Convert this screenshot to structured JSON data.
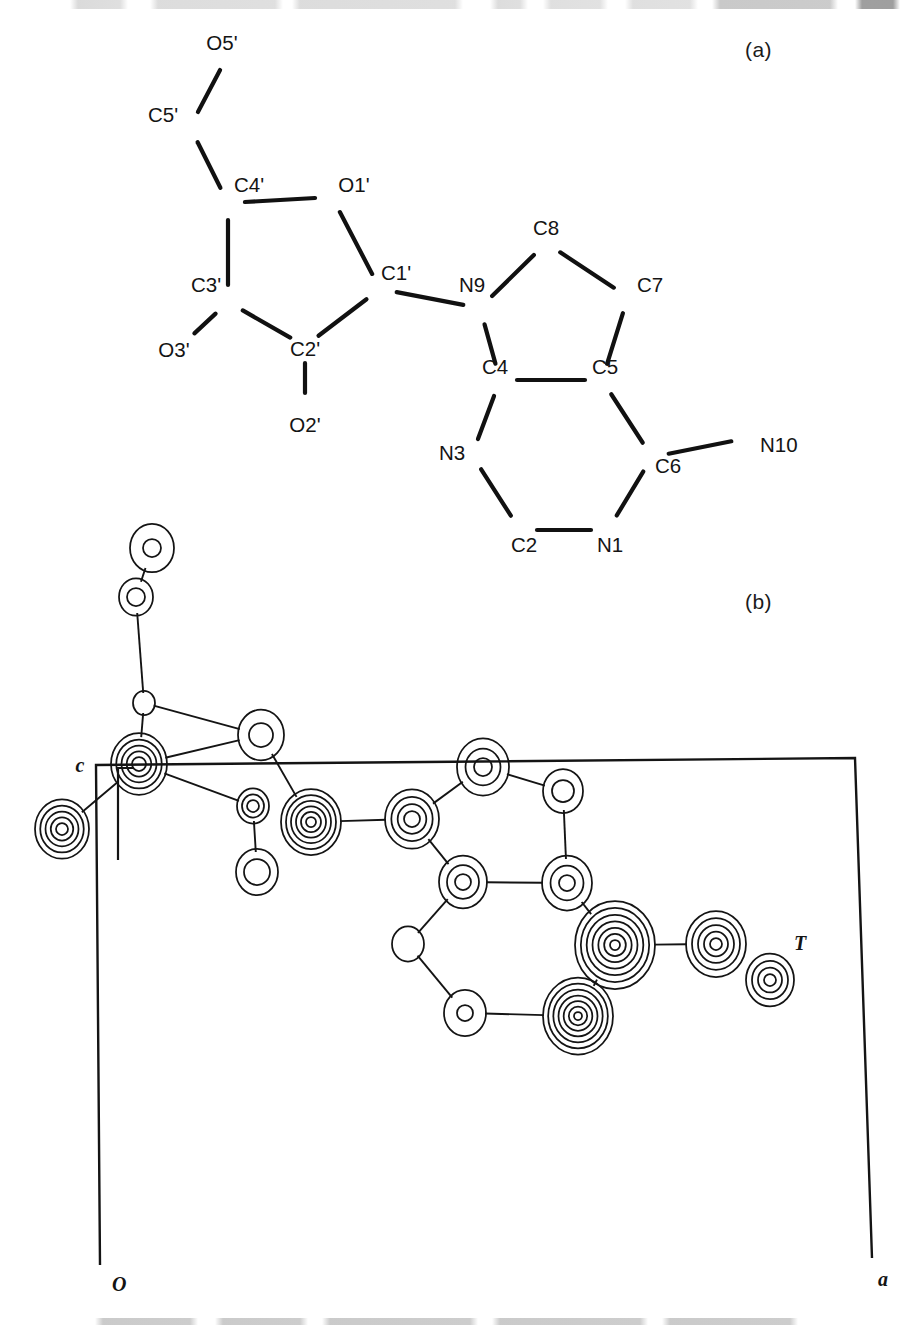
{
  "figure": {
    "panel_a_label": "(a)",
    "panel_b_label": "(b)",
    "panel_a_type": "atom-numbering-diagram",
    "panel_b_type": "electron-density-contour-map"
  },
  "chart_data": {
    "type": "scatter",
    "title": "",
    "subtitle": "",
    "xlabel": "a",
    "ylabel": "c",
    "grid": false,
    "legend": null,
    "panels": [
      {
        "id": "a",
        "label": "(a)",
        "kind": "molecular-skeleton",
        "description": "Atom-numbering scheme of the nucleoside: ribose sugar ring plus 7-deazapurine base",
        "atoms": [
          {
            "name": "O5'",
            "label": "O5'",
            "x": 228,
            "y": 55,
            "lx": 222,
            "ly": 50,
            "anchor": "middle"
          },
          {
            "name": "C5'",
            "label": "C5'",
            "x": 190,
            "y": 127,
            "lx": 163,
            "ly": 122,
            "anchor": "middle"
          },
          {
            "name": "C4'",
            "label": "C4'",
            "x": 228,
            "y": 203,
            "lx": 249,
            "ly": 192,
            "anchor": "middle"
          },
          {
            "name": "O1'",
            "label": "O1'",
            "x": 332,
            "y": 197,
            "lx": 354,
            "ly": 192,
            "anchor": "middle"
          },
          {
            "name": "C1'",
            "label": "C1'",
            "x": 380,
            "y": 289,
            "lx": 396,
            "ly": 280,
            "anchor": "middle"
          },
          {
            "name": "C2'",
            "label": "C2'",
            "x": 305,
            "y": 346,
            "lx": 305,
            "ly": 356,
            "anchor": "middle"
          },
          {
            "name": "C3'",
            "label": "C3'",
            "x": 228,
            "y": 302,
            "lx": 206,
            "ly": 292,
            "anchor": "middle"
          },
          {
            "name": "O3'",
            "label": "O3'",
            "x": 182,
            "y": 345,
            "lx": 174,
            "ly": 357,
            "anchor": "middle"
          },
          {
            "name": "O2'",
            "label": "O2'",
            "x": 305,
            "y": 410,
            "lx": 305,
            "ly": 432,
            "anchor": "middle"
          },
          {
            "name": "N9",
            "label": "N9",
            "x": 480,
            "y": 308,
            "lx": 472,
            "ly": 292,
            "anchor": "middle"
          },
          {
            "name": "C8",
            "label": "C8",
            "x": 546,
            "y": 243,
            "lx": 546,
            "ly": 235,
            "anchor": "middle"
          },
          {
            "name": "C7",
            "label": "C7",
            "x": 628,
            "y": 297,
            "lx": 650,
            "ly": 292,
            "anchor": "middle"
          },
          {
            "name": "C5",
            "label": "C5",
            "x": 602,
            "y": 380,
            "lx": 605,
            "ly": 374,
            "anchor": "middle"
          },
          {
            "name": "C4",
            "label": "C4",
            "x": 500,
            "y": 380,
            "lx": 495,
            "ly": 374,
            "anchor": "middle"
          },
          {
            "name": "N3",
            "label": "N3",
            "x": 472,
            "y": 455,
            "lx": 452,
            "ly": 460,
            "anchor": "middle"
          },
          {
            "name": "C2",
            "label": "C2",
            "x": 520,
            "y": 530,
            "lx": 524,
            "ly": 552,
            "anchor": "middle"
          },
          {
            "name": "N1",
            "label": "N1",
            "x": 608,
            "y": 530,
            "lx": 610,
            "ly": 552,
            "anchor": "middle"
          },
          {
            "name": "C6",
            "label": "C6",
            "x": 652,
            "y": 457,
            "lx": 668,
            "ly": 473,
            "anchor": "middle"
          },
          {
            "name": "N10",
            "label": "N10",
            "x": 748,
            "y": 438,
            "lx": 760,
            "ly": 452,
            "anchor": "start"
          }
        ],
        "bonds": [
          [
            "O5'",
            "C5'"
          ],
          [
            "C5'",
            "C4'"
          ],
          [
            "C4'",
            "O1'"
          ],
          [
            "O1'",
            "C1'"
          ],
          [
            "C1'",
            "C2'"
          ],
          [
            "C2'",
            "C3'"
          ],
          [
            "C3'",
            "C4'"
          ],
          [
            "C3'",
            "O3'"
          ],
          [
            "C2'",
            "O2'"
          ],
          [
            "C1'",
            "N9"
          ],
          [
            "N9",
            "C8"
          ],
          [
            "C8",
            "C7"
          ],
          [
            "C7",
            "C5"
          ],
          [
            "C5",
            "C4"
          ],
          [
            "C4",
            "N9"
          ],
          [
            "C4",
            "N3"
          ],
          [
            "N3",
            "C2"
          ],
          [
            "C2",
            "N1"
          ],
          [
            "N1",
            "C6"
          ],
          [
            "C6",
            "C5"
          ],
          [
            "C6",
            "N10"
          ]
        ]
      },
      {
        "id": "b",
        "label": "(b)",
        "kind": "contour-density-map",
        "description": "Electron density map projected down the b axis onto the a-c plane of the unit cell",
        "axis_labels": {
          "origin": "O",
          "horizontal": "a",
          "vertical": "c"
        },
        "site_label": "T",
        "unit_cell_outline": [
          [
            100,
            1265
          ],
          [
            96,
            765
          ],
          [
            855,
            758
          ],
          [
            872,
            1258
          ]
        ],
        "c_bracket": {
          "tick_x": 118,
          "top_y": 768,
          "bottom_y": 860,
          "stub_len": 16,
          "label_x": 80,
          "label_y": 766
        },
        "t_label": {
          "x": 800,
          "y": 950
        },
        "contour_atoms": [
          {
            "name": "O5'",
            "x": 152,
            "y": 548,
            "rings": 2,
            "rmax": 22,
            "rmin": 9
          },
          {
            "name": "C5'",
            "x": 136,
            "y": 597,
            "rings": 2,
            "rmax": 17,
            "rmin": 9
          },
          {
            "name": "C4'",
            "x": 144,
            "y": 703,
            "rings": 1,
            "rmax": 11,
            "rmin": 11
          },
          {
            "name": "O1'",
            "x": 261,
            "y": 735,
            "rings": 2,
            "rmax": 23,
            "rmin": 12
          },
          {
            "name": "C3'",
            "x": 139,
            "y": 764,
            "rings": 5,
            "rmax": 28,
            "rmin": 7
          },
          {
            "name": "O3'",
            "x": 62,
            "y": 829,
            "rings": 5,
            "rmax": 27,
            "rmin": 6
          },
          {
            "name": "C1'",
            "x": 253,
            "y": 806,
            "rings": 3,
            "rmax": 16,
            "rmin": 6
          },
          {
            "name": "O2'",
            "x": 257,
            "y": 872,
            "rings": 2,
            "rmax": 21,
            "rmin": 13
          },
          {
            "name": "C2'",
            "x": 311,
            "y": 822,
            "rings": 6,
            "rmax": 30,
            "rmin": 5
          },
          {
            "name": "N9",
            "x": 412,
            "y": 819,
            "rings": 4,
            "rmax": 27,
            "rmin": 8
          },
          {
            "name": "C8",
            "x": 483,
            "y": 767,
            "rings": 3,
            "rmax": 26,
            "rmin": 9
          },
          {
            "name": "C7",
            "x": 563,
            "y": 791,
            "rings": 2,
            "rmax": 20,
            "rmin": 11
          },
          {
            "name": "C5",
            "x": 567,
            "y": 883,
            "rings": 3,
            "rmax": 25,
            "rmin": 8
          },
          {
            "name": "C4",
            "x": 463,
            "y": 882,
            "rings": 3,
            "rmax": 24,
            "rmin": 8
          },
          {
            "name": "N3",
            "x": 408,
            "y": 944,
            "rings": 1,
            "rmax": 16,
            "rmin": 16
          },
          {
            "name": "C2",
            "x": 465,
            "y": 1013,
            "rings": 2,
            "rmax": 21,
            "rmin": 8
          },
          {
            "name": "N1",
            "x": 578,
            "y": 1016,
            "rings": 7,
            "rmax": 35,
            "rmin": 4
          },
          {
            "name": "C6",
            "x": 615,
            "y": 945,
            "rings": 7,
            "rmax": 40,
            "rmin": 5
          },
          {
            "name": "N10",
            "x": 716,
            "y": 944,
            "rings": 5,
            "rmax": 30,
            "rmin": 6
          },
          {
            "name": "T",
            "x": 770,
            "y": 980,
            "rings": 4,
            "rmax": 24,
            "rmin": 6
          }
        ],
        "contour_bonds": [
          [
            "O5'",
            "C5'"
          ],
          [
            "C5'",
            "C4'"
          ],
          [
            "C4'",
            "O1'"
          ],
          [
            "C4'",
            "C3'"
          ],
          [
            "C3'",
            "O3'"
          ],
          [
            "C3'",
            "C1'"
          ],
          [
            "C1'",
            "O2'"
          ],
          [
            "O1'",
            "C2'"
          ],
          [
            "C2'",
            "N9"
          ],
          [
            "N9",
            "C8"
          ],
          [
            "C8",
            "C7"
          ],
          [
            "C7",
            "C5"
          ],
          [
            "C5",
            "C4"
          ],
          [
            "C4",
            "N9"
          ],
          [
            "C4",
            "N3"
          ],
          [
            "N3",
            "C2"
          ],
          [
            "C2",
            "N1"
          ],
          [
            "N1",
            "C6"
          ],
          [
            "C6",
            "C5"
          ],
          [
            "C6",
            "N10"
          ],
          [
            "C3'",
            "O1'"
          ]
        ]
      }
    ]
  }
}
